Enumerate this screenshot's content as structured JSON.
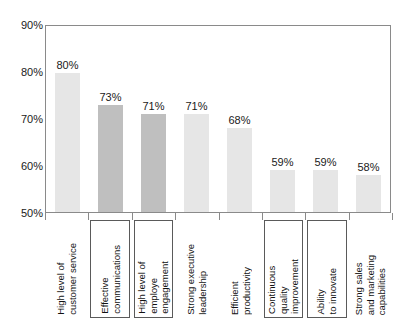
{
  "chart_data": {
    "type": "bar",
    "title": "",
    "subtitle": "",
    "xlabel": "",
    "ylabel": "",
    "ylim": [
      50,
      90
    ],
    "y_tick_labels": [
      "90%",
      "80%",
      "70%",
      "60%",
      "50%"
    ],
    "y_tick_values": [
      90,
      80,
      70,
      60,
      50
    ],
    "grid": false,
    "legend": "none",
    "value_suffix": "%",
    "categories": [
      "High level of\ncustomer service",
      "Effective\ncommunications",
      "High level of\nemploye\nengagement",
      "Strong executive\nleadership",
      "Efficient\nproductivity",
      "Continuous\nquality\nimprovement",
      "Ability\nto innovate",
      "Strong sales\nand marketing\ncapabilities"
    ],
    "values": [
      80,
      73,
      71,
      71,
      68,
      59,
      59,
      58
    ],
    "value_labels": [
      "80%",
      "73%",
      "71%",
      "71%",
      "68%",
      "59%",
      "59%",
      "58%"
    ],
    "highlighted": [
      false,
      true,
      true,
      false,
      false,
      false,
      false,
      false
    ],
    "boxed_labels": [
      false,
      true,
      true,
      false,
      false,
      true,
      true,
      false
    ],
    "colors": {
      "bar_normal": "#e6e6e6",
      "bar_highlight": "#bfbfbf",
      "axis": "#8a8a8a",
      "text": "#1a1a1a",
      "label_box_border": "#5a5a5a",
      "background": "#ffffff"
    }
  }
}
